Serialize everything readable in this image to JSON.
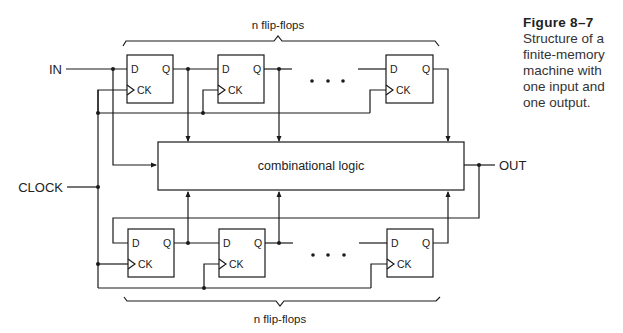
{
  "figure": {
    "number_label": "Figure 8–7",
    "caption": "Structure of a\nfinite-memory\nmachine with\none input and\none output."
  },
  "diagram": {
    "title": "Structure of a finite-memory machine",
    "inputs": {
      "in_label": "IN",
      "clock_label": "CLOCK"
    },
    "outputs": {
      "out_label": "OUT"
    },
    "logic_block_label": "combinational logic",
    "top_group": {
      "brace_label": "n flip-flops"
    },
    "bottom_group": {
      "brace_label": "n flip-flops"
    },
    "flip_flop": {
      "d_label": "D",
      "q_label": "Q",
      "ck_label": "CK"
    },
    "ellipsis": "• • •",
    "colors": {
      "line": "#1a1a1a",
      "text": "#222222",
      "background": "#ffffff"
    }
  }
}
